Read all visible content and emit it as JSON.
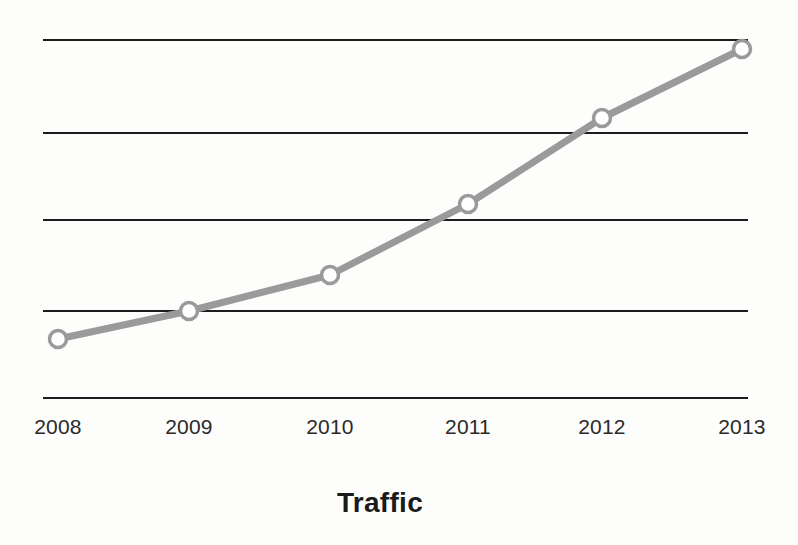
{
  "chart_data": {
    "type": "line",
    "title": "Traffic",
    "xlabel": "",
    "ylabel": "",
    "categories": [
      "2008",
      "2009",
      "2010",
      "2011",
      "2012",
      "2013"
    ],
    "x": [
      2008,
      2009,
      2010,
      2011,
      2012,
      2013
    ],
    "series": [
      {
        "name": "Traffic",
        "values": [
          0.66,
          0.97,
          1.37,
          2.17,
          3.13,
          3.9
        ],
        "line_color": "#9a9a9a",
        "marker": "circle-open",
        "marker_fill": "#ffffff",
        "marker_edge_color": "#9a9a9a"
      }
    ],
    "ylim": [
      0,
      4.0
    ],
    "yticks": [
      0,
      1,
      2,
      3,
      4
    ],
    "ytick_labels": [
      "",
      "",
      "",
      "",
      ""
    ],
    "grid": true,
    "grid_color": "#1c1c1c",
    "grid_orientation": "horizontal",
    "legend": false,
    "legend_position": "none",
    "background_color": "#fdfdfc",
    "plot_background_color": "#ffffff"
  },
  "axis": {
    "x_tick_labels": [
      {
        "label": "2008",
        "x_px": 58
      },
      {
        "label": "2009",
        "x_px": 189
      },
      {
        "label": "2010",
        "x_px": 330
      },
      {
        "label": "2011",
        "x_px": 468
      },
      {
        "label": "2012",
        "x_px": 602
      },
      {
        "label": "2013",
        "x_px": 742
      }
    ]
  },
  "gridlines": [
    {
      "y_px": 40
    },
    {
      "y_px": 133
    },
    {
      "y_px": 220
    },
    {
      "y_px": 311
    },
    {
      "y_px": 398
    }
  ],
  "points": [
    {
      "label": "2008",
      "cx": 58,
      "cy": 339
    },
    {
      "label": "2009",
      "cx": 189,
      "cy": 311
    },
    {
      "label": "2010",
      "cx": 330,
      "cy": 275
    },
    {
      "label": "2011",
      "cx": 468,
      "cy": 204
    },
    {
      "label": "2012",
      "cx": 602,
      "cy": 118
    },
    {
      "label": "2013",
      "cx": 742,
      "cy": 49
    }
  ],
  "geometry": {
    "grid_left": 43,
    "grid_right": 748,
    "line_width": 7,
    "marker_radius": 8.5,
    "marker_stroke_width": 3.5
  },
  "title": {
    "text": "Traffic"
  }
}
